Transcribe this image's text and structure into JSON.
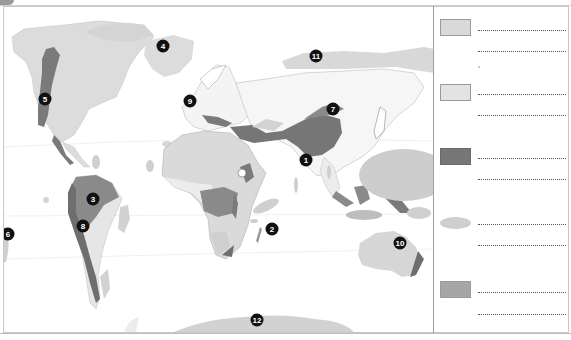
{
  "map": {
    "title": "World map worksheet",
    "colors": {
      "land": "#dcdcdc",
      "light_region": "#d2d2d2",
      "mountain_dark": "#7a7a7a",
      "mid_region": "#9c9c9c",
      "ocean_oval": "#bdbdbd",
      "border": "#9e9e9e"
    },
    "markers": [
      {
        "label": "1",
        "x": 302,
        "y": 160
      },
      {
        "label": "2",
        "x": 272,
        "y": 230
      },
      {
        "label": "3",
        "x": 93,
        "y": 200
      },
      {
        "label": "4",
        "x": 163,
        "y": 46
      },
      {
        "label": "5",
        "x": 45,
        "y": 99
      },
      {
        "label": "6",
        "x": 7,
        "y": 234
      },
      {
        "label": "7",
        "x": 333,
        "y": 109
      },
      {
        "label": "8",
        "x": 83,
        "y": 226
      },
      {
        "label": "9",
        "x": 190,
        "y": 101
      },
      {
        "label": "10",
        "x": 400,
        "y": 243
      },
      {
        "label": "11",
        "x": 316,
        "y": 56
      },
      {
        "label": "12",
        "x": 257,
        "y": 320
      }
    ]
  },
  "legend": {
    "items": [
      {
        "swatch": "light-box",
        "color": "#d9d9d9",
        "lines": [
          "",
          ""
        ]
      },
      {
        "swatch": "light-box",
        "color": "#e3e3e3",
        "lines": [
          "",
          ""
        ]
      },
      {
        "swatch": "dark-box",
        "color": "#777777",
        "lines": [
          "",
          ""
        ]
      },
      {
        "swatch": "oval",
        "color": "#cfcfcf",
        "lines": [
          "",
          ""
        ]
      },
      {
        "swatch": "mid-box",
        "color": "#a6a6a6",
        "lines": [
          "",
          ""
        ]
      }
    ]
  }
}
